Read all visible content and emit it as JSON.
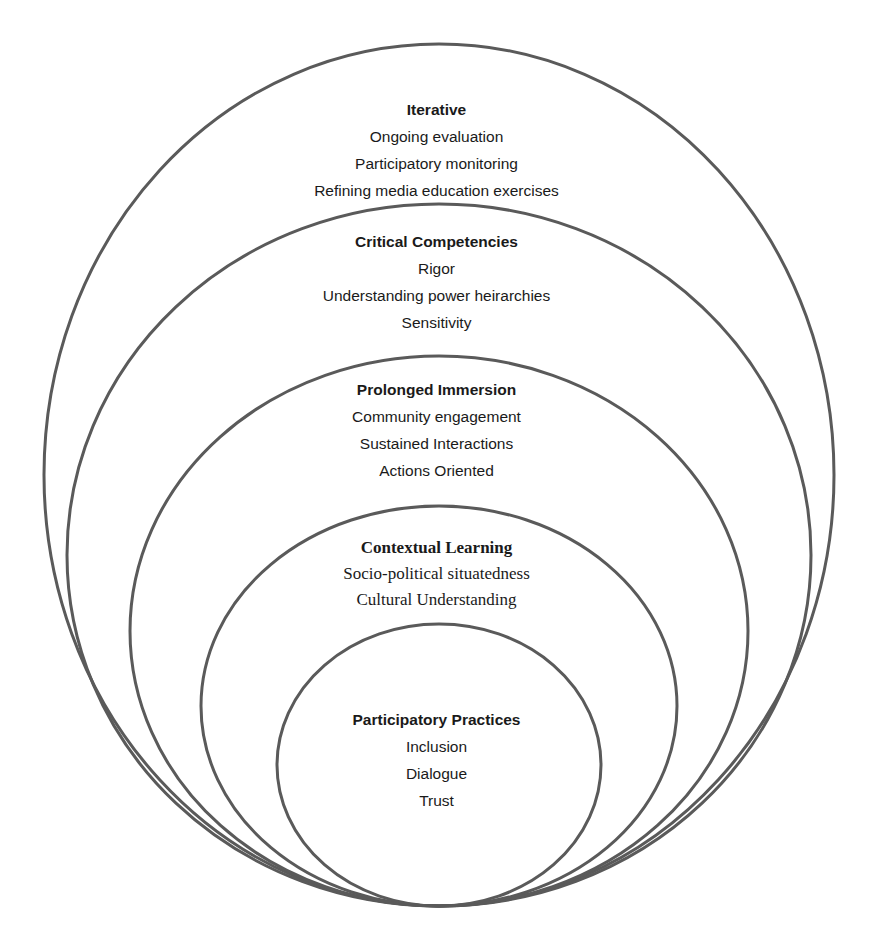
{
  "diagram": {
    "type": "nested-ellipses",
    "stroke_color": "#5a5a5a",
    "layers": [
      {
        "title": "Iterative",
        "items": [
          "Ongoing evaluation",
          "Participatory monitoring",
          "Refining media education exercises"
        ]
      },
      {
        "title": "Critical Competencies",
        "items": [
          "Rigor",
          "Understanding power heirarchies",
          "Sensitivity"
        ]
      },
      {
        "title": "Prolonged Immersion",
        "items": [
          "Community engagement",
          "Sustained Interactions",
          "Actions Oriented"
        ]
      },
      {
        "title": "Contextual Learning",
        "items": [
          "Socio-political situatedness",
          "Cultural Understanding"
        ]
      },
      {
        "title": "Participatory Practices",
        "items": [
          "Inclusion",
          "Dialogue",
          "Trust"
        ]
      }
    ]
  }
}
